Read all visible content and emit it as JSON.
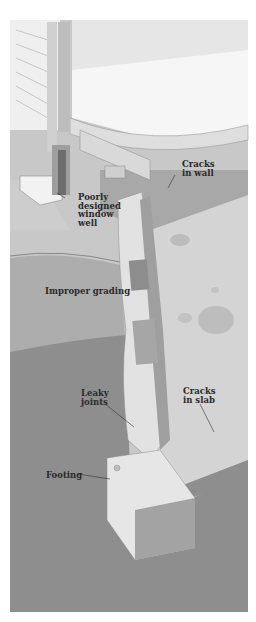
{
  "diagram": {
    "colors": {
      "background": "#ffffff",
      "house_siding": "#efefef",
      "interior_wall": "#e4e4e4",
      "floor": "#f7f7f7",
      "soil_dark": "#8c8c8c",
      "soil_mid": "#aeaeae",
      "basement_floor": "#cfcfcf",
      "foundation_wall": "#9c9c9c",
      "label_text": "#2a2a2a"
    },
    "labels": [
      {
        "id": "cracks-in-wall",
        "text": "Cracks\nin wall"
      },
      {
        "id": "poorly-designed-window-well",
        "text": "Poorly\ndesigned\nwindow\nwell"
      },
      {
        "id": "improper-grading",
        "text": "Improper grading"
      },
      {
        "id": "leaky-joints",
        "text": "Leaky\njoints"
      },
      {
        "id": "cracks-in-slab",
        "text": "Cracks\nin slab"
      },
      {
        "id": "footing",
        "text": "Footing"
      }
    ]
  }
}
